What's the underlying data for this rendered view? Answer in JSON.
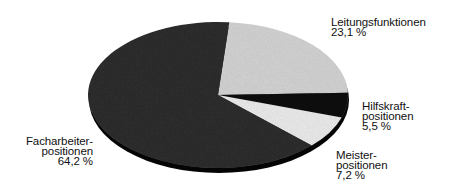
{
  "chart_data": {
    "type": "pie",
    "title": "",
    "style": "3d-tilted",
    "start_angle_deg": 5,
    "direction": "clockwise",
    "slices": [
      {
        "label": "Leitungsfunktionen",
        "value": 23.1,
        "value_label": "23,1 %",
        "color": "#d4d4d4"
      },
      {
        "label": "Hilfskraftpositionen",
        "value": 5.5,
        "value_label": "5,5 %",
        "color": "#0a0a0a"
      },
      {
        "label": "Meisterpositionen",
        "value": 7.2,
        "value_label": "7,2 %",
        "color": "#ececec"
      },
      {
        "label": "Facharbeiterpositionen",
        "value": 64.2,
        "value_label": "64,2 %",
        "color": "#2e2e2e"
      }
    ],
    "rim_color": "#050505",
    "geometry": {
      "cx": 218,
      "cy": 95,
      "rx": 130,
      "ry": 73,
      "depth": 5
    }
  },
  "labels": {
    "leitung": {
      "line1": "Leitungsfunktionen",
      "line2": "23,1 %"
    },
    "hilfskraft": {
      "line1": "Hilfskraft-",
      "line2": "positionen",
      "line3": "5,5 %"
    },
    "meister": {
      "line1": "Meister-",
      "line2": "positionen",
      "line3": "7,2 %"
    },
    "facharbeiter": {
      "line1": "Facharbeiter-",
      "line2": "positionen",
      "line3": "64,2 %"
    }
  }
}
